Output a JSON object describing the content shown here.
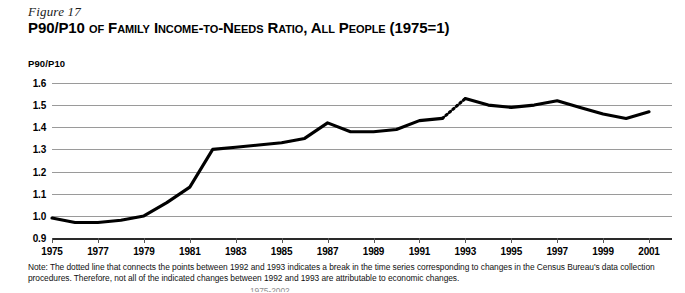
{
  "figure": {
    "number": "Figure 17",
    "title_lead": "P90/P10",
    "title_rest": " of Family Income-to-Needs Ratio, All People (1975=1)",
    "title_full": "P90/P10 of Family Income-to-Needs Ratio, All People (1975=1)"
  },
  "note": {
    "text": "Note: The dotted line that connects the points between 1992 and 1993 indicates a break in the time series corresponding to changes in the Census Bureau's data collection procedures. Therefore, not all of the indicated changes between 1992 and 1993 are attributable to economic changes.",
    "cutoff_line": "1975-2002"
  },
  "colors": {
    "series": "#000000",
    "gridline": "#9a9a9a",
    "axis": "#2a2a2a",
    "background": "#ffffff"
  },
  "chart_data": {
    "type": "line",
    "title": "P90/P10 of Family Income-to-Needs Ratio, All People (1975=1)",
    "xlabel": "",
    "ylabel": "P90/P10",
    "ylim": [
      0.9,
      1.6
    ],
    "xlim": [
      1975,
      2002
    ],
    "grid": true,
    "legend": null,
    "ytick_labels": [
      "1.6",
      "1.5",
      "1.4",
      "1.3",
      "1.2",
      "1.1",
      "1.0",
      "0.9"
    ],
    "yticks": [
      1.6,
      1.5,
      1.4,
      1.3,
      1.2,
      1.1,
      1.0,
      0.9
    ],
    "xtick_labels": [
      "1975",
      "1977",
      "1979",
      "1981",
      "1983",
      "1985",
      "1987",
      "1989",
      "1991",
      "1993",
      "1995",
      "1997",
      "1999",
      "2001"
    ],
    "xticks": [
      1975,
      1977,
      1979,
      1981,
      1983,
      1985,
      1987,
      1989,
      1991,
      1993,
      1995,
      1997,
      1999,
      2001
    ],
    "x": [
      1975,
      1976,
      1977,
      1978,
      1979,
      1980,
      1981,
      1982,
      1983,
      1984,
      1985,
      1986,
      1987,
      1988,
      1989,
      1990,
      1991,
      1992,
      1993,
      1994,
      1995,
      1996,
      1997,
      1998,
      1999,
      2000,
      2001
    ],
    "values": [
      0.99,
      0.97,
      0.97,
      0.98,
      1.0,
      1.06,
      1.13,
      1.3,
      1.31,
      1.32,
      1.33,
      1.35,
      1.42,
      1.38,
      1.38,
      1.39,
      1.43,
      1.44,
      1.53,
      1.5,
      1.49,
      1.5,
      1.52,
      1.49,
      1.46,
      1.44,
      1.47
    ],
    "break_segment": {
      "from_x": 1992,
      "to_x": 1993,
      "from_y": 1.44,
      "to_y": 1.53,
      "style": "dotted",
      "reason": "break in time series due to Census Bureau data collection changes"
    }
  }
}
